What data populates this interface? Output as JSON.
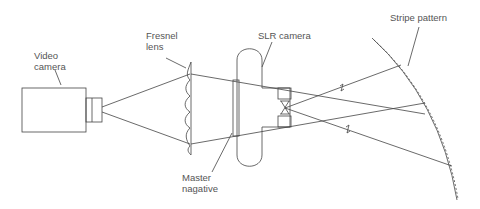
{
  "diagram": {
    "labels": {
      "video_camera": [
        "Video",
        "camera"
      ],
      "fresnel_lens": [
        "Fresnel",
        "lens"
      ],
      "slr_camera": "SLR camera",
      "master_negative": [
        "Master",
        "nagative"
      ],
      "stripe_pattern": "Stripe pattern"
    },
    "colors": {
      "line": "#444444",
      "text": "#555555",
      "background": "#ffffff"
    }
  }
}
